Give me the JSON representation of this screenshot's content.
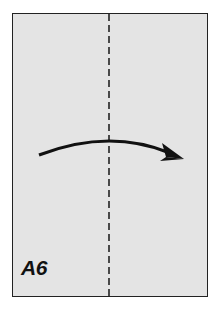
{
  "diagram": {
    "type": "paper-fold-step",
    "label": "A6",
    "fold_line": "vertical-center-dashed",
    "arrow_direction": "left-to-right",
    "colors": {
      "paper": "#e4e4e4",
      "border": "#222222",
      "arrow": "#111111",
      "label": "#111111"
    }
  }
}
